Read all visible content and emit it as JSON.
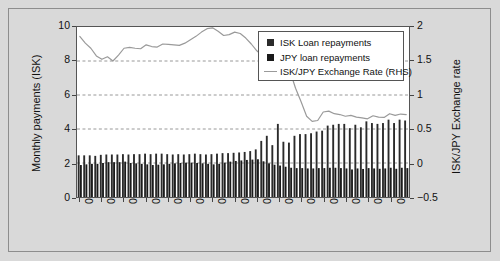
{
  "figure": {
    "background_color": "#d9d9d9",
    "plot_background": "#ffffff"
  },
  "legend": {
    "position": "top-right-inside",
    "items": [
      {
        "label": "ISK Loan repayments",
        "marker": "square",
        "color": "#2b2b2b"
      },
      {
        "label": "JPY loan repayments",
        "marker": "square",
        "color": "#1a1a1a"
      },
      {
        "label": "ISK/JPY Exchange Rate (RHS)",
        "marker": "line",
        "color": "#9a9a9a"
      }
    ]
  },
  "chart_data": {
    "type": "bar",
    "title": "",
    "subtitle": "",
    "xlabel": "",
    "ylabel": "Monthly payments (ISK)",
    "y2label": "ISK/JPY Exchange rate",
    "ylim": [
      0,
      10
    ],
    "y2lim": [
      -0.5,
      2
    ],
    "yticks": [
      "0",
      "2",
      "4",
      "6",
      "8",
      "10"
    ],
    "y2ticks": [
      "-0.5",
      "0",
      "0.5",
      "1",
      "1.5",
      "2"
    ],
    "grid": "horizontal-dashed",
    "legend_position": "upper right",
    "x_tick_labels": [
      "01/06",
      "05/06",
      "09/06",
      "01/07",
      "05/07",
      "09/07",
      "01/08",
      "05/08",
      "09/08",
      "01/09",
      "05/09",
      "09/09",
      "01/10",
      "05/10",
      "09/10"
    ],
    "x_tick_every": 4,
    "categories": [
      "01/06",
      "02/06",
      "03/06",
      "04/06",
      "05/06",
      "06/06",
      "07/06",
      "08/06",
      "09/06",
      "10/06",
      "11/06",
      "12/06",
      "01/07",
      "02/07",
      "03/07",
      "04/07",
      "05/07",
      "06/07",
      "07/07",
      "08/07",
      "09/07",
      "10/07",
      "11/07",
      "12/07",
      "01/08",
      "02/08",
      "03/08",
      "04/08",
      "05/08",
      "06/08",
      "07/08",
      "08/08",
      "09/08",
      "10/08",
      "11/08",
      "12/08",
      "01/09",
      "02/09",
      "03/09",
      "04/09",
      "05/09",
      "06/09",
      "07/09",
      "08/09",
      "09/09",
      "10/09",
      "11/09",
      "12/09",
      "01/10",
      "02/10",
      "03/10",
      "04/10",
      "05/10",
      "06/10",
      "07/10",
      "08/10",
      "09/10",
      "10/10",
      "11/10",
      "12/10"
    ],
    "series": [
      {
        "name": "ISK Loan repayments",
        "type": "bar",
        "color": "#2b2b2b",
        "axis": "left",
        "values": [
          2.45,
          2.45,
          2.45,
          2.42,
          2.48,
          2.5,
          2.5,
          2.5,
          2.52,
          2.5,
          2.52,
          2.52,
          2.55,
          2.52,
          2.55,
          2.55,
          2.52,
          2.5,
          2.52,
          2.5,
          2.52,
          2.55,
          2.52,
          2.5,
          2.52,
          2.55,
          2.58,
          2.58,
          2.6,
          2.62,
          2.65,
          2.7,
          2.8,
          3.3,
          3.6,
          3.05,
          4.3,
          3.25,
          3.2,
          3.6,
          3.7,
          3.7,
          3.75,
          3.85,
          3.9,
          4.2,
          4.25,
          4.3,
          4.3,
          4.05,
          4.25,
          4.1,
          4.45,
          4.35,
          4.3,
          4.35,
          4.55,
          4.35,
          4.55,
          4.5
        ]
      },
      {
        "name": "JPY loan repayments",
        "type": "bar",
        "color": "#1a1a1a",
        "axis": "left",
        "values": [
          1.88,
          1.92,
          1.95,
          1.95,
          2.0,
          2.05,
          2.05,
          2.05,
          2.08,
          2.0,
          1.98,
          1.95,
          1.92,
          1.88,
          1.9,
          1.92,
          1.95,
          1.98,
          2.0,
          2.02,
          2.02,
          2.0,
          1.98,
          1.95,
          1.92,
          1.95,
          2.02,
          2.08,
          2.12,
          2.15,
          2.18,
          2.2,
          2.22,
          2.1,
          1.98,
          1.9,
          1.85,
          1.78,
          1.72,
          1.7,
          1.7,
          1.68,
          1.68,
          1.7,
          1.7,
          1.72,
          1.72,
          1.7,
          1.68,
          1.62,
          1.68,
          1.65,
          1.7,
          1.68,
          1.66,
          1.68,
          1.72,
          1.66,
          1.72,
          1.7
        ]
      },
      {
        "name": "ISK/JPY Exchange Rate (RHS)",
        "type": "line",
        "color": "#9a9a9a",
        "axis": "right",
        "values_left_scale": [
          9.45,
          9.05,
          8.75,
          8.3,
          8.1,
          8.25,
          8.0,
          8.35,
          8.75,
          8.8,
          8.75,
          8.72,
          8.95,
          8.85,
          8.82,
          9.0,
          8.98,
          8.95,
          8.92,
          9.05,
          9.25,
          9.45,
          9.7,
          9.9,
          9.95,
          9.75,
          9.5,
          9.55,
          9.7,
          9.62,
          9.35,
          9.0,
          8.6,
          8.3,
          7.55,
          7.25,
          7.6,
          7.45,
          7.4,
          6.4,
          5.6,
          4.75,
          4.45,
          4.5,
          5.0,
          5.05,
          4.9,
          4.85,
          4.75,
          4.8,
          4.7,
          4.65,
          4.6,
          4.78,
          4.7,
          4.68,
          4.9,
          4.8,
          4.88,
          4.85
        ],
        "values": [
          1.89,
          1.81,
          1.75,
          1.66,
          1.62,
          1.65,
          1.6,
          1.67,
          1.75,
          1.76,
          1.75,
          1.744,
          1.79,
          1.77,
          1.764,
          1.8,
          1.796,
          1.79,
          1.784,
          1.81,
          1.85,
          1.89,
          1.94,
          1.98,
          1.99,
          1.95,
          1.9,
          1.91,
          1.94,
          1.924,
          1.87,
          1.8,
          1.72,
          1.66,
          1.51,
          1.45,
          1.52,
          1.49,
          1.48,
          1.28,
          1.12,
          0.95,
          0.89,
          0.9,
          1.0,
          1.01,
          0.98,
          0.97,
          0.95,
          0.96,
          0.94,
          0.93,
          0.92,
          0.956,
          0.94,
          0.936,
          0.98,
          0.96,
          0.976,
          0.97
        ]
      }
    ]
  }
}
